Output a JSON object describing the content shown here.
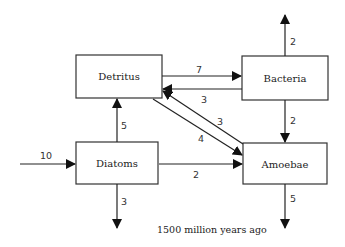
{
  "diagram": {
    "caption": "1500 million years ago",
    "nodes": {
      "detritus": "Detritus",
      "bacteria": "Bacteria",
      "diatoms": "Diatoms",
      "amoebae": "Amoebae"
    },
    "flows": {
      "input_diatoms": "10",
      "diatoms_to_detritus": "5",
      "diatoms_out": "3",
      "diatoms_to_amoebae": "2",
      "detritus_to_bacteria": "7",
      "bacteria_to_detritus": "3",
      "bacteria_out": "2",
      "bacteria_to_amoebae": "2",
      "amoebae_to_detritus": "3",
      "detritus_to_amoebae": "4",
      "amoebae_out": "5"
    }
  }
}
